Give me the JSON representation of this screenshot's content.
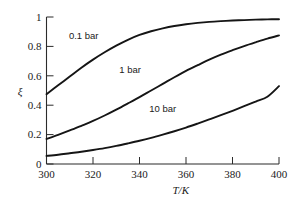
{
  "chart_data": {
    "type": "line",
    "title": "",
    "subtitle": "",
    "xlabel": "T/K",
    "ylabel": "ξ",
    "xlim": [
      300,
      400
    ],
    "ylim": [
      0,
      1
    ],
    "grid": false,
    "legend_position": "inline-annotations",
    "xticks": [
      300,
      320,
      340,
      360,
      380,
      400
    ],
    "xtick_labels": [
      "300",
      "320",
      "340",
      "360",
      "380",
      "400"
    ],
    "yticks": [
      0,
      0.2,
      0.4,
      0.6,
      0.8,
      1
    ],
    "ytick_labels": [
      "0",
      "0.2",
      "0.4",
      "0.6",
      "0.8",
      "1"
    ],
    "x": [
      300,
      305,
      310,
      315,
      320,
      325,
      330,
      335,
      340,
      345,
      350,
      355,
      360,
      365,
      370,
      375,
      380,
      385,
      390,
      395,
      400
    ],
    "series": [
      {
        "name": "0.1 bar",
        "label": "0.1 bar",
        "label_x": 316,
        "label_y": 0.875,
        "values": [
          0.475,
          0.535,
          0.595,
          0.655,
          0.71,
          0.76,
          0.805,
          0.845,
          0.878,
          0.903,
          0.923,
          0.939,
          0.951,
          0.96,
          0.967,
          0.972,
          0.976,
          0.979,
          0.982,
          0.984,
          0.985
        ]
      },
      {
        "name": "1 bar",
        "label": "1 bar",
        "label_x": 336,
        "label_y": 0.645,
        "values": [
          0.17,
          0.198,
          0.228,
          0.26,
          0.293,
          0.33,
          0.37,
          0.412,
          0.455,
          0.5,
          0.545,
          0.59,
          0.633,
          0.672,
          0.71,
          0.744,
          0.774,
          0.802,
          0.828,
          0.853,
          0.875
        ]
      },
      {
        "name": "10 bar",
        "label": "10 bar",
        "label_x": 350,
        "label_y": 0.375,
        "values": [
          0.055,
          0.063,
          0.073,
          0.083,
          0.095,
          0.108,
          0.123,
          0.14,
          0.158,
          0.178,
          0.2,
          0.223,
          0.248,
          0.275,
          0.303,
          0.332,
          0.362,
          0.393,
          0.425,
          0.458,
          0.53
        ]
      }
    ]
  },
  "axes": {
    "x_axis_title": "T/K",
    "y_axis_title": "ξ"
  }
}
